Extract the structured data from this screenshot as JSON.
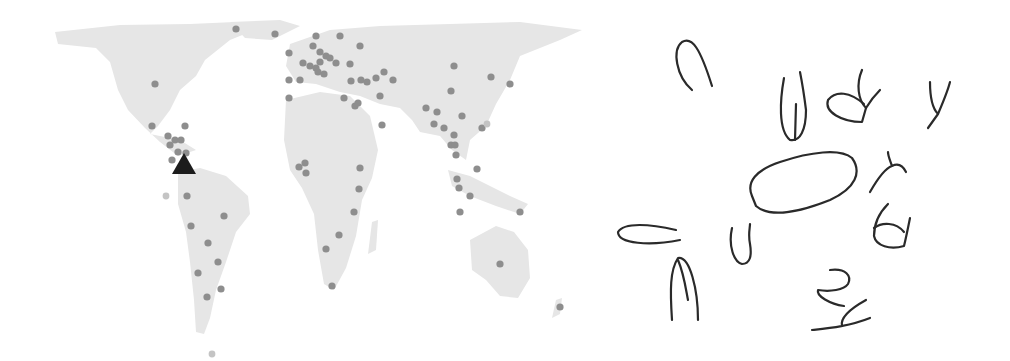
{
  "map": {
    "title": "",
    "land_color": "#e6e6e6",
    "dot_color": "#8e8e8e",
    "marker": {
      "type": "triangle",
      "color": "#1c1c1c",
      "x": 184,
      "y": 164
    },
    "points": [
      [
        236,
        29
      ],
      [
        275,
        34
      ],
      [
        316,
        36
      ],
      [
        340,
        36
      ],
      [
        289,
        53
      ],
      [
        313,
        46
      ],
      [
        320,
        52
      ],
      [
        326,
        56
      ],
      [
        303,
        63
      ],
      [
        310,
        66
      ],
      [
        316,
        68
      ],
      [
        320,
        62
      ],
      [
        330,
        58
      ],
      [
        336,
        63
      ],
      [
        318,
        72
      ],
      [
        324,
        74
      ],
      [
        360,
        46
      ],
      [
        350,
        64
      ],
      [
        361,
        80
      ],
      [
        367,
        82
      ],
      [
        376,
        78
      ],
      [
        384,
        72
      ],
      [
        393,
        80
      ],
      [
        454,
        66
      ],
      [
        491,
        77
      ],
      [
        510,
        84
      ],
      [
        451,
        91
      ],
      [
        289,
        80
      ],
      [
        300,
        80
      ],
      [
        289,
        98
      ],
      [
        351,
        81
      ],
      [
        344,
        98
      ],
      [
        355,
        106
      ],
      [
        358,
        103
      ],
      [
        380,
        96
      ],
      [
        382,
        125
      ],
      [
        426,
        108
      ],
      [
        437,
        112
      ],
      [
        434,
        124
      ],
      [
        444,
        128
      ],
      [
        454,
        135
      ],
      [
        451,
        145
      ],
      [
        455,
        145
      ],
      [
        456,
        155
      ],
      [
        482,
        128
      ],
      [
        462,
        116
      ],
      [
        155,
        84
      ],
      [
        152,
        126
      ],
      [
        185,
        126
      ],
      [
        175,
        140
      ],
      [
        170,
        145
      ],
      [
        186,
        153
      ],
      [
        178,
        152
      ],
      [
        172,
        160
      ],
      [
        168,
        136
      ],
      [
        181,
        140
      ],
      [
        305,
        163
      ],
      [
        299,
        167
      ],
      [
        306,
        173
      ],
      [
        360,
        168
      ],
      [
        359,
        189
      ],
      [
        354,
        212
      ],
      [
        339,
        235
      ],
      [
        326,
        249
      ],
      [
        332,
        286
      ],
      [
        187,
        196
      ],
      [
        224,
        216
      ],
      [
        191,
        226
      ],
      [
        208,
        243
      ],
      [
        218,
        262
      ],
      [
        198,
        273
      ],
      [
        221,
        289
      ],
      [
        207,
        297
      ],
      [
        457,
        179
      ],
      [
        459,
        188
      ],
      [
        477,
        169
      ],
      [
        470,
        196
      ],
      [
        460,
        212
      ],
      [
        520,
        212
      ],
      [
        500,
        264
      ],
      [
        560,
        307
      ]
    ],
    "faint_points": [
      [
        166,
        196
      ],
      [
        212,
        354
      ],
      [
        487,
        124
      ]
    ]
  },
  "sketch": {
    "strokes": 14
  }
}
